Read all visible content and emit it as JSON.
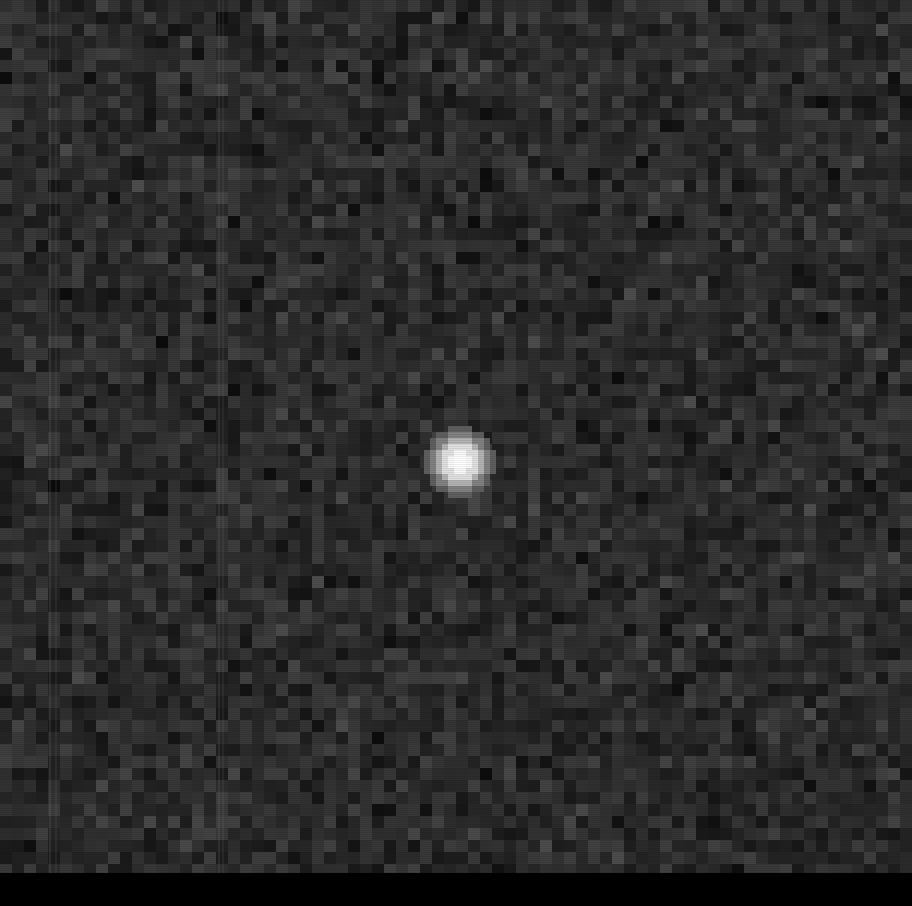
{
  "image": {
    "kind": "astronomical CCD frame",
    "width": 912,
    "height": 906,
    "frame_height": 873,
    "background_color": "#000000",
    "noise": {
      "block_size": 12,
      "min_gray": 8,
      "max_gray": 82,
      "mean_gray": 42,
      "seed": 1337
    },
    "point_source": {
      "center_x": 460,
      "center_y": 462,
      "core_size": 24,
      "halo_size": 72,
      "core_color": "#ffffff",
      "halo_color": "#9a9a9a"
    },
    "column_artifacts": [
      {
        "x": 49,
        "opacity": 0.45
      },
      {
        "x": 55,
        "opacity": 0.3
      },
      {
        "x": 218,
        "opacity": 0.4
      },
      {
        "x": 222,
        "opacity": 0.3
      }
    ],
    "bottom_strip": {
      "top": 873,
      "height": 33,
      "color": "#000000"
    }
  }
}
